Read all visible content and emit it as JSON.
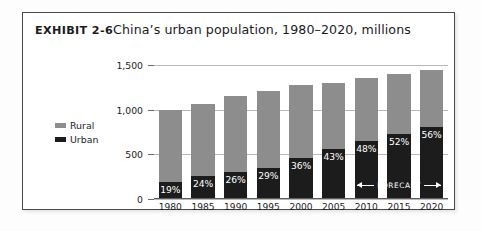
{
  "exhibit": {
    "tag": "EXHIBIT 2-6",
    "description": "China’s urban population, 1980–2020, millions"
  },
  "legend": {
    "items": [
      {
        "label": "Rural",
        "color": "#8d8d8d",
        "key": "rural"
      },
      {
        "label": "Urban",
        "color": "#1c1c1c",
        "key": "urban"
      }
    ]
  },
  "annotation": {
    "forecast_label": "FORECAST"
  },
  "colors": {
    "rural": "#8d8d8d",
    "urban": "#1c1c1c",
    "gridline": "#b9b9b9",
    "frame": "#4a4a4a",
    "text": "#1d1d1d"
  },
  "chart_data": {
    "type": "bar",
    "title": "China’s urban population, 1980–2020, millions",
    "subtitle": "EXHIBIT 2-6",
    "stacked": true,
    "xlabel": "",
    "ylabel": "",
    "ylim": [
      0,
      1500
    ],
    "yticks": [
      0,
      500,
      1000,
      1500
    ],
    "ytick_labels": [
      "0",
      "500",
      "1,000",
      "1,500"
    ],
    "grid": true,
    "legend_position": "left",
    "categories": [
      "1980",
      "1985",
      "1990",
      "1995",
      "2000",
      "2005",
      "2010",
      "2015",
      "2020"
    ],
    "series": [
      {
        "name": "Urban",
        "color": "#1c1c1c",
        "values": [
          190,
          255,
          300,
          350,
          460,
          560,
          650,
          730,
          810
        ]
      },
      {
        "name": "Rural",
        "color": "#8d8d8d",
        "values": [
          810,
          805,
          855,
          855,
          820,
          740,
          705,
          675,
          635
        ]
      }
    ],
    "totals": [
      1000,
      1060,
      1155,
      1205,
      1280,
      1300,
      1355,
      1405,
      1445
    ],
    "data_labels": [
      "19%",
      "24%",
      "26%",
      "29%",
      "36%",
      "43%",
      "48%",
      "52%",
      "56%"
    ],
    "annotations": [
      {
        "text": "FORECAST",
        "from_category": "2010",
        "to_category": "2020",
        "style": "double-arrow"
      }
    ]
  }
}
